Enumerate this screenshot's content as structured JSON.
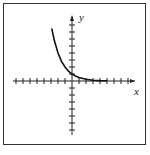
{
  "chart_data": {
    "type": "line",
    "title": "",
    "xlabel": "x",
    "ylabel": "y",
    "grid": false,
    "function": "exponential decay (approx. y = (1/2)^x)",
    "x": [
      -2.9,
      -2.5,
      -2,
      -1.5,
      -1,
      -0.5,
      0,
      0.5,
      1,
      2,
      3,
      4,
      5
    ],
    "values": [
      7.5,
      5.7,
      4,
      2.8,
      2,
      1.4,
      1,
      0.7,
      0.5,
      0.25,
      0.12,
      0.06,
      0.03
    ],
    "xlim": [
      -8,
      8
    ],
    "ylim": [
      -8,
      8
    ],
    "tick_spacing": 1
  },
  "labels": {
    "x_axis": "x",
    "y_axis": "y"
  }
}
